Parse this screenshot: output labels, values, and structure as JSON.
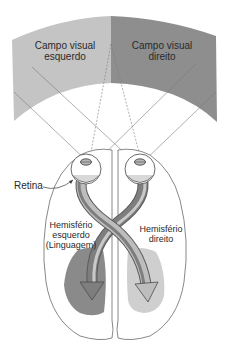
{
  "diagram": {
    "type": "visual-pathway-hemispheres",
    "labels": {
      "left_field_line1": "Campo visual",
      "left_field_line2": "esquerdo",
      "right_field_line1": "Campo visual",
      "right_field_line2": "direito",
      "retina": "Retina",
      "left_hemi_line1": "Hemisfério",
      "left_hemi_line2": "esquerdo",
      "left_hemi_line3": "(Linguagem)",
      "right_hemi_line1": "Hemisfério",
      "right_hemi_line2": "direito"
    },
    "colors": {
      "left_field": "#c4c4c4",
      "right_field": "#8e8e8e",
      "left_region": "#8a8a8a",
      "right_region": "#cfcfcf",
      "outline": "#6a6a6a",
      "arrow_dark": "#7a7a7a",
      "arrow_light": "#c9c9c9"
    }
  }
}
